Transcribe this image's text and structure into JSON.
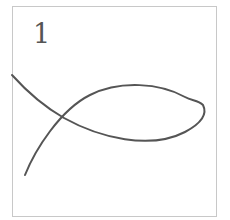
{
  "figure": {
    "label": "1",
    "stroke_color": "#555555",
    "frame_color": "#c8c8c8"
  }
}
